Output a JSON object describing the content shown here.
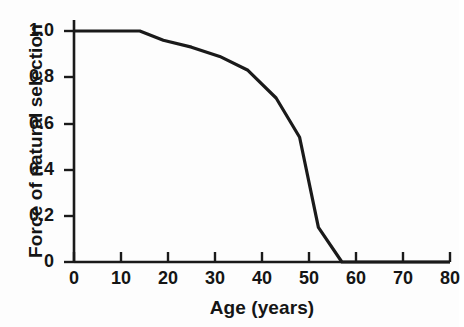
{
  "chart_data": {
    "type": "line",
    "title": "",
    "xlabel": "Age (years)",
    "ylabel": "Force of natural selection",
    "xlim": [
      0,
      80
    ],
    "ylim": [
      0,
      1.0
    ],
    "grid": false,
    "legend": null,
    "xticks": [
      0,
      10,
      20,
      30,
      40,
      50,
      60,
      70,
      80
    ],
    "xtick_labels": [
      "0",
      "10",
      "20",
      "30",
      "40",
      "50",
      "60",
      "70",
      "80"
    ],
    "yticks": [
      0,
      0.2,
      0.4,
      0.6,
      0.8,
      1.0
    ],
    "ytick_labels": [
      "0",
      "0.2",
      "0.4",
      "0.6",
      "0.8",
      "1.0"
    ],
    "series": [
      {
        "name": "Force of natural selection",
        "color": "#1a1a1a",
        "x": [
          0,
          14,
          19,
          25,
          31,
          37,
          43,
          48,
          52,
          57,
          80
        ],
        "values": [
          1.0,
          1.0,
          0.96,
          0.93,
          0.89,
          0.83,
          0.71,
          0.54,
          0.15,
          0.0,
          0.0
        ]
      }
    ]
  },
  "axes": {
    "x_title": "Age (years)",
    "y_title": "Force of natural selection"
  }
}
